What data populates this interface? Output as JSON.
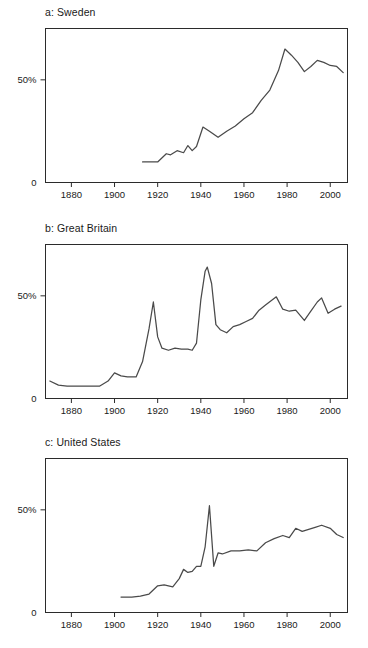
{
  "figure": {
    "background": "#ffffff",
    "line_color": "#4a4a4a",
    "axis_color": "#2b2b2b"
  },
  "panels": [
    {
      "id": "a",
      "title": "a: Sweden"
    },
    {
      "id": "b",
      "title": "b: Great Britain"
    },
    {
      "id": "c",
      "title": "c: United States"
    }
  ],
  "axis": {
    "x_ticks": [
      1880,
      1900,
      1920,
      1940,
      1960,
      1980,
      2000
    ],
    "x_tick_labels": [
      "1880",
      "1900",
      "1920",
      "1940",
      "1960",
      "1980",
      "2000"
    ],
    "y_ticks": [
      0,
      50
    ],
    "y_tick_labels": [
      "0",
      "50%"
    ],
    "xlim": [
      1868,
      2008
    ],
    "ylim": [
      0,
      75
    ]
  },
  "chart_data": [
    {
      "type": "line",
      "title": "a: Sweden",
      "xlabel": "",
      "ylabel": "",
      "xlim": [
        1868,
        2008
      ],
      "ylim": [
        0,
        75
      ],
      "grid": false,
      "legend": "none",
      "x": [
        1913,
        1916,
        1920,
        1924,
        1926,
        1929,
        1932,
        1934,
        1936,
        1938,
        1941,
        1944,
        1948,
        1952,
        1956,
        1960,
        1964,
        1968,
        1972,
        1976,
        1979,
        1982,
        1985,
        1988,
        1991,
        1994,
        1997,
        2000,
        2003,
        2006
      ],
      "y": [
        10.0,
        10.0,
        10.0,
        14.0,
        13.5,
        15.5,
        14.5,
        18.0,
        15.5,
        17.5,
        27.0,
        25.0,
        22.0,
        25.0,
        27.5,
        31.0,
        34.0,
        40.0,
        45.0,
        54.5,
        65.0,
        62.0,
        58.5,
        54.0,
        56.5,
        59.5,
        58.5,
        57.0,
        56.5,
        53.5
      ],
      "series": [
        {
          "name": "Sweden",
          "values": [
            10.0,
            10.0,
            10.0,
            14.0,
            13.5,
            15.5,
            14.5,
            18.0,
            15.5,
            17.5,
            27.0,
            25.0,
            22.0,
            25.0,
            27.5,
            31.0,
            34.0,
            40.0,
            45.0,
            54.5,
            65.0,
            62.0,
            58.5,
            54.0,
            56.5,
            59.5,
            58.5,
            57.0,
            56.5,
            53.5
          ]
        }
      ]
    },
    {
      "type": "line",
      "title": "b: Great Britain",
      "xlabel": "",
      "ylabel": "",
      "xlim": [
        1868,
        2008
      ],
      "ylim": [
        0,
        75
      ],
      "grid": false,
      "legend": "none",
      "x": [
        1870,
        1874,
        1878,
        1882,
        1886,
        1890,
        1893,
        1897,
        1900,
        1903,
        1906,
        1910,
        1913,
        1916,
        1918,
        1920,
        1922,
        1925,
        1928,
        1931,
        1934,
        1936,
        1938,
        1940,
        1942,
        1943,
        1945,
        1947,
        1949,
        1952,
        1955,
        1958,
        1961,
        1964,
        1967,
        1970,
        1975,
        1978,
        1981,
        1984,
        1988,
        1991,
        1994,
        1996,
        1999,
        2002,
        2005
      ],
      "y": [
        8.5,
        6.5,
        6.0,
        6.0,
        6.0,
        6.0,
        6.0,
        8.5,
        12.5,
        11.0,
        10.5,
        10.5,
        18.0,
        34.0,
        47.0,
        30.0,
        24.5,
        23.5,
        24.5,
        24.0,
        24.0,
        23.5,
        27.0,
        48.0,
        62.0,
        64.0,
        56.0,
        36.0,
        33.5,
        32.0,
        35.0,
        36.0,
        37.5,
        39.0,
        43.0,
        45.5,
        49.5,
        43.5,
        42.5,
        43.0,
        38.0,
        42.5,
        47.0,
        49.0,
        41.5,
        43.5,
        45.0
      ],
      "series": [
        {
          "name": "Great Britain",
          "values": [
            8.5,
            6.5,
            6.0,
            6.0,
            6.0,
            6.0,
            6.0,
            8.5,
            12.5,
            11.0,
            10.5,
            10.5,
            18.0,
            34.0,
            47.0,
            30.0,
            24.5,
            23.5,
            24.5,
            24.0,
            24.0,
            23.5,
            27.0,
            48.0,
            62.0,
            64.0,
            56.0,
            36.0,
            33.5,
            32.0,
            35.0,
            36.0,
            37.5,
            39.0,
            43.0,
            45.5,
            49.5,
            43.5,
            42.5,
            43.0,
            38.0,
            42.5,
            47.0,
            49.0,
            41.5,
            43.5,
            45.0
          ]
        }
      ]
    },
    {
      "type": "line",
      "title": "c: United States",
      "xlabel": "",
      "ylabel": "",
      "xlim": [
        1868,
        2008
      ],
      "ylim": [
        0,
        75
      ],
      "grid": false,
      "legend": "none",
      "x": [
        1903,
        1908,
        1912,
        1916,
        1920,
        1923,
        1927,
        1930,
        1932,
        1934,
        1936,
        1938,
        1940,
        1942,
        1944,
        1946,
        1948,
        1950,
        1954,
        1958,
        1962,
        1966,
        1970,
        1974,
        1978,
        1981,
        1984,
        1987,
        1990,
        1993,
        1996,
        2000,
        2003,
        2006
      ],
      "y": [
        7.5,
        7.5,
        8.0,
        9.0,
        13.0,
        13.5,
        12.5,
        16.5,
        21.0,
        19.5,
        20.0,
        22.5,
        22.5,
        32.0,
        52.0,
        22.5,
        29.0,
        28.5,
        30.0,
        30.0,
        30.5,
        30.0,
        34.0,
        36.0,
        37.5,
        36.5,
        41.0,
        39.5,
        40.5,
        41.5,
        42.5,
        41.0,
        38.0,
        36.5
      ],
      "series": [
        {
          "name": "United States",
          "values": [
            7.5,
            7.5,
            8.0,
            9.0,
            13.0,
            13.5,
            12.5,
            16.5,
            21.0,
            19.5,
            20.0,
            22.5,
            22.5,
            32.0,
            52.0,
            22.5,
            29.0,
            28.5,
            30.0,
            30.0,
            30.5,
            30.0,
            34.0,
            36.0,
            37.5,
            36.5,
            41.0,
            39.5,
            40.5,
            41.5,
            42.5,
            41.0,
            38.0,
            36.5
          ]
        }
      ]
    }
  ]
}
